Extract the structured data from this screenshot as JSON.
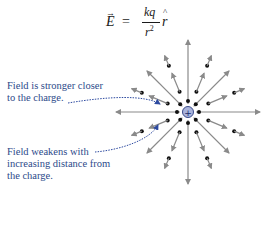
{
  "formula": {
    "lhs": "E",
    "lhs_vector_mark": "→",
    "equals": "=",
    "numerator": "kq",
    "denominator_base": "r",
    "denominator_exp": "2",
    "unit_vector": "r",
    "unit_vector_mark": "^"
  },
  "annotations": [
    {
      "line1": "Field is stronger closer",
      "line2": "to the charge."
    },
    {
      "line1": "Field weakens with",
      "line2": "increasing distance from",
      "line3": "the charge."
    }
  ],
  "charge": {
    "symbol": "+",
    "fill": "#aab4dc",
    "stroke": "#3a4a8a"
  },
  "colors": {
    "arrow": "#8a8a8a",
    "dot": "#111111",
    "annotation_text": "#2d4a8a",
    "annotation_line": "#2d4aa0"
  }
}
